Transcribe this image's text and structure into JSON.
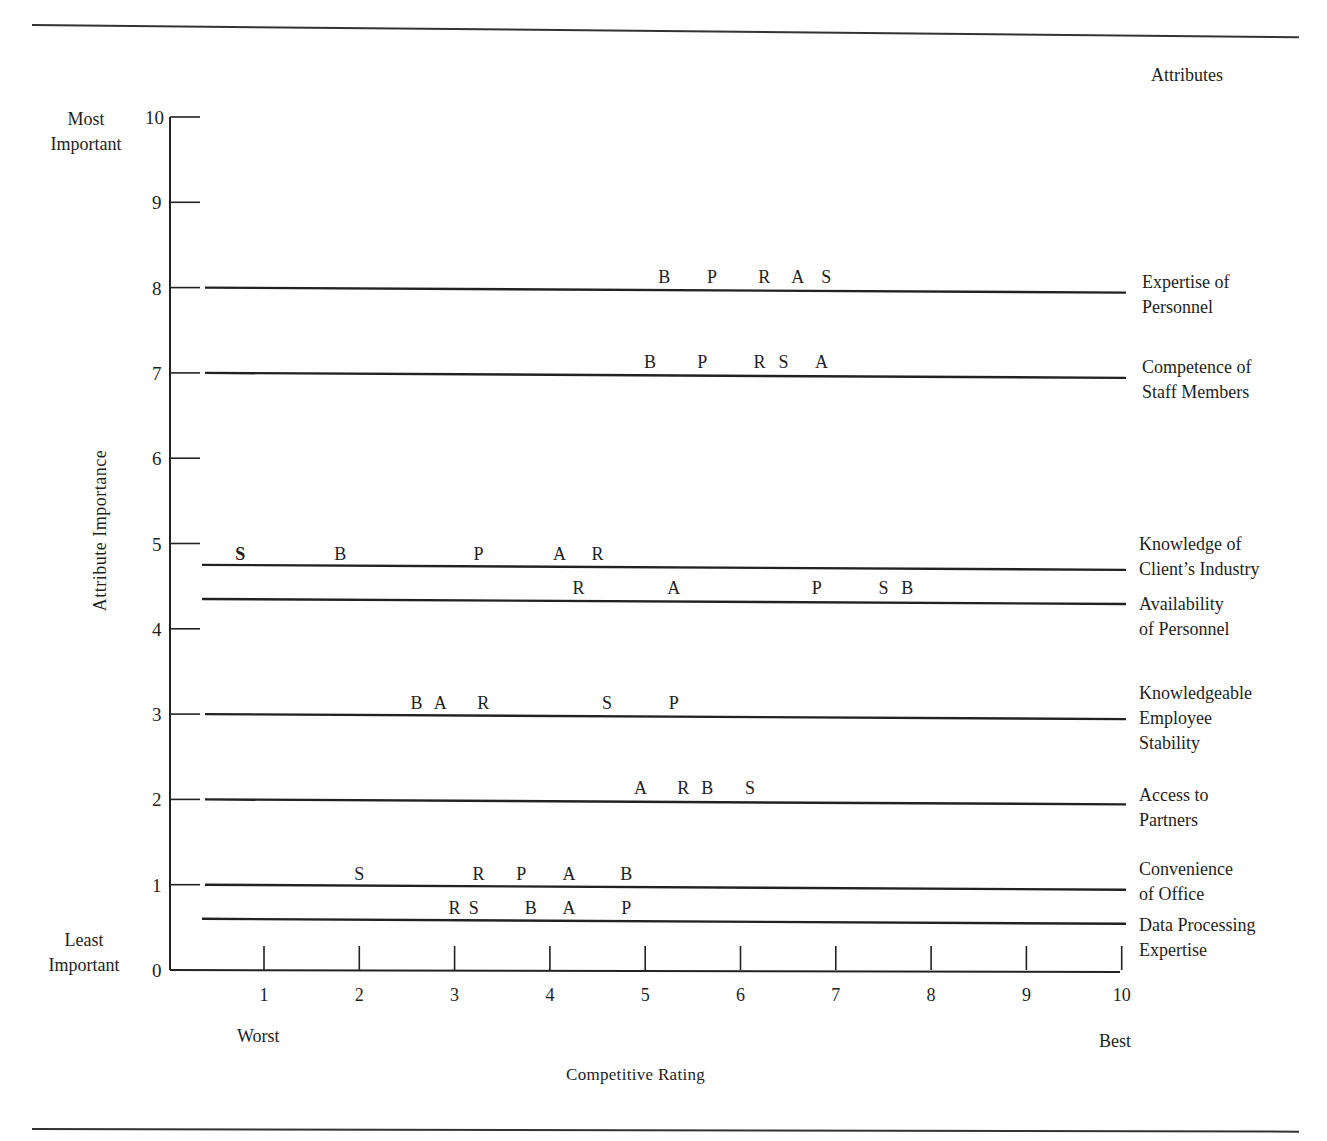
{
  "page": {
    "header_text_partial": "",
    "attributes_heading": "Attributes",
    "y_axis_title": "Attribute Importance",
    "x_axis_title": "Competitive Rating",
    "y_top_label": "Most\nImportant",
    "y_bottom_label": "Least\nImportant",
    "x_left_label": "Worst",
    "x_right_label": "Best"
  },
  "chart_data": {
    "type": "scatter",
    "title": "",
    "xlabel": "Competitive Rating",
    "ylabel": "Attribute Importance",
    "xlim": [
      0,
      10
    ],
    "ylim": [
      0,
      10
    ],
    "x_ticks": [
      "1",
      "2",
      "3",
      "4",
      "5",
      "6",
      "7",
      "8",
      "9",
      "10"
    ],
    "y_ticks": [
      "0",
      "1",
      "2",
      "3",
      "4",
      "5",
      "6",
      "7",
      "8",
      "9",
      "10"
    ],
    "x_extremes": {
      "low": "Worst",
      "high": "Best"
    },
    "y_extremes": {
      "low": "Least Important",
      "high": "Most Important"
    },
    "legend_title": "Attributes",
    "grid": false,
    "attributes": [
      {
        "name": "Expertise of Personnel",
        "label": "Expertise of\nPersonnel",
        "importance": 8.0,
        "ratings": [
          {
            "firm": "B",
            "x": 5.2
          },
          {
            "firm": "P",
            "x": 5.7
          },
          {
            "firm": "R",
            "x": 6.25
          },
          {
            "firm": "A",
            "x": 6.6
          },
          {
            "firm": "S",
            "x": 6.9
          }
        ]
      },
      {
        "name": "Competence of Staff Members",
        "label": "Competence of\nStaff Members",
        "importance": 7.0,
        "ratings": [
          {
            "firm": "B",
            "x": 5.05
          },
          {
            "firm": "P",
            "x": 5.6
          },
          {
            "firm": "R",
            "x": 6.2
          },
          {
            "firm": "S",
            "x": 6.45
          },
          {
            "firm": "A",
            "x": 6.85
          }
        ]
      },
      {
        "name": "Knowledge of Client's Industry",
        "label": "Knowledge of\nClient’s Industry",
        "importance": 4.75,
        "ratings": [
          {
            "firm": "S",
            "x": 0.75,
            "bold": true
          },
          {
            "firm": "B",
            "x": 1.8
          },
          {
            "firm": "P",
            "x": 3.25
          },
          {
            "firm": "A",
            "x": 4.1
          },
          {
            "firm": "R",
            "x": 4.5
          }
        ]
      },
      {
        "name": "Availability of Personnel",
        "label": "Availability\nof Personnel",
        "importance": 4.35,
        "ratings": [
          {
            "firm": "R",
            "x": 4.3
          },
          {
            "firm": "A",
            "x": 5.3
          },
          {
            "firm": "P",
            "x": 6.8
          },
          {
            "firm": "S",
            "x": 7.5
          },
          {
            "firm": "B",
            "x": 7.75
          }
        ]
      },
      {
        "name": "Knowledgeable Employee Stability",
        "label": "Knowledgeable\nEmployee\nStability",
        "importance": 3.0,
        "ratings": [
          {
            "firm": "B",
            "x": 2.6
          },
          {
            "firm": "A",
            "x": 2.85
          },
          {
            "firm": "R",
            "x": 3.3
          },
          {
            "firm": "S",
            "x": 4.6
          },
          {
            "firm": "P",
            "x": 5.3
          }
        ]
      },
      {
        "name": "Access to Partners",
        "label": "Access to\nPartners",
        "importance": 2.0,
        "ratings": [
          {
            "firm": "A",
            "x": 4.95
          },
          {
            "firm": "R",
            "x": 5.4
          },
          {
            "firm": "B",
            "x": 5.65
          },
          {
            "firm": "S",
            "x": 6.1
          }
        ]
      },
      {
        "name": "Convenience of Office",
        "label": "Convenience\nof Office",
        "importance": 1.0,
        "ratings": [
          {
            "firm": "S",
            "x": 2.0
          },
          {
            "firm": "R",
            "x": 3.25
          },
          {
            "firm": "P",
            "x": 3.7
          },
          {
            "firm": "A",
            "x": 4.2
          },
          {
            "firm": "B",
            "x": 4.8
          }
        ]
      },
      {
        "name": "Data Processing Expertise",
        "label": "Data Processing\nExpertise",
        "importance": 0.6,
        "ratings": [
          {
            "firm": "R",
            "x": 3.0
          },
          {
            "firm": "S",
            "x": 3.2
          },
          {
            "firm": "B",
            "x": 3.8
          },
          {
            "firm": "A",
            "x": 4.2
          },
          {
            "firm": "P",
            "x": 4.8
          }
        ]
      }
    ]
  }
}
